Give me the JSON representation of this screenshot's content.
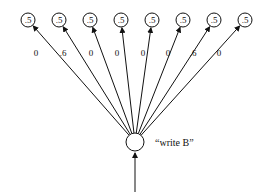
{
  "diagram": {
    "source_node": {
      "cx": 135,
      "cy": 142,
      "r": 9,
      "label": "“write B”",
      "label_x": 155,
      "label_y": 146
    },
    "input_arrow": {
      "x": 135,
      "y1": 192,
      "y2": 152
    },
    "output_nodes": [
      {
        "cx": 28,
        "cy": 20,
        "value": ".5",
        "weight": "0",
        "wx": 36,
        "wy": 56
      },
      {
        "cx": 59,
        "cy": 20,
        "value": ".5",
        "weight": ".6",
        "wx": 63,
        "wy": 56
      },
      {
        "cx": 90,
        "cy": 20,
        "value": ".5",
        "weight": "0",
        "wx": 91,
        "wy": 56
      },
      {
        "cx": 121,
        "cy": 20,
        "value": ".5",
        "weight": "0",
        "wx": 117,
        "wy": 56
      },
      {
        "cx": 152,
        "cy": 20,
        "value": ".5",
        "weight": "0",
        "wx": 143,
        "wy": 56
      },
      {
        "cx": 183,
        "cy": 20,
        "value": ".5",
        "weight": "0",
        "wx": 168,
        "wy": 56
      },
      {
        "cx": 214,
        "cy": 20,
        "value": ".5",
        "weight": ".6",
        "wx": 193,
        "wy": 56
      },
      {
        "cx": 245,
        "cy": 20,
        "value": ".5",
        "weight": "0",
        "wx": 219,
        "wy": 56
      }
    ],
    "node_radius": 7,
    "stroke_color": "#111111"
  }
}
